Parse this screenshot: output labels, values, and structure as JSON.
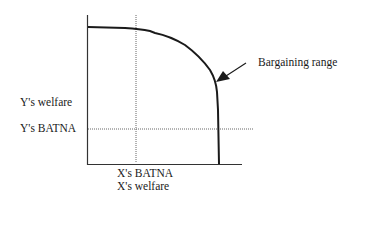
{
  "diagram": {
    "type": "bargaining-range",
    "labels": {
      "y_axis": "Y's welfare",
      "y_batna": "Y's BATNA",
      "x_batna": "X's BATNA",
      "x_axis": "X's welfare",
      "annotation": "Bargaining range"
    },
    "colors": {
      "line": "#1a1a1a",
      "dotted": "#555555",
      "background": "#ffffff"
    }
  }
}
